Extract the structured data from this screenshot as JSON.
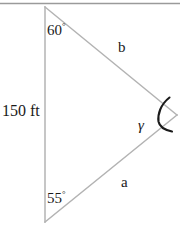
{
  "figure": {
    "type": "geometry-diagram",
    "shape": "triangle",
    "background_color": "#ffffff",
    "stroke_color": "#b0b0b0",
    "arc_color": "#1a1a1a",
    "text_color": "#1a1a1a",
    "top_rule_color": "#9a9a9a",
    "vertices": {
      "top": {
        "x": 45,
        "y": 7
      },
      "bottom": {
        "x": 45,
        "y": 222
      },
      "right": {
        "x": 177,
        "y": 115
      }
    },
    "labels": {
      "side_c": "150 ft",
      "side_b": "b",
      "side_a": "a",
      "angle_top": "60",
      "angle_top_unit": "°",
      "angle_bottom": "55",
      "angle_bottom_unit": "°",
      "angle_right": "γ"
    }
  }
}
